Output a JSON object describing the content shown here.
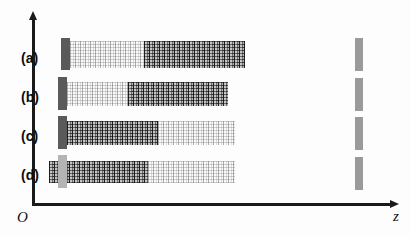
{
  "figure": {
    "title": "",
    "background": "#fdfdfd",
    "width": 411,
    "height": 237
  },
  "axes": {
    "origin_label": "O",
    "x_axis_label": "z",
    "y_axis_label": "",
    "axis_color": "#1a1a1a",
    "vertical": {
      "x": 32,
      "y_top": 14,
      "y_bottom": 205,
      "thickness": 3
    },
    "horizontal": {
      "y": 205,
      "x_left": 32,
      "x_right": 398,
      "thickness": 3
    },
    "origin_label_pos": {
      "x": 16,
      "y": 210
    },
    "x_axis_label_pos": {
      "x": 394,
      "y": 209
    }
  },
  "colors": {
    "source_dark": "#5a5a5a",
    "source_light": "#b4b4b4",
    "detector_gray": "#9a9a9a",
    "mesh_dark": "#3c3c3c",
    "mesh_light": "#d8d8d8",
    "axis": "#1a1a1a",
    "label_text": "#0d0d0d"
  },
  "rows": [
    {
      "label": "(a)",
      "label_pos": {
        "x": 21,
        "y": 51
      },
      "y": 40,
      "height": 28,
      "source": {
        "x": 61,
        "y": 38,
        "width": 9,
        "height": 32,
        "shade": "dark"
      },
      "segments": [
        {
          "kind": "light",
          "x": 70,
          "width": 74
        },
        {
          "kind": "dark",
          "x": 144,
          "width": 101
        }
      ],
      "detector": {
        "x": 355,
        "y": 38,
        "width": 8,
        "height": 33
      }
    },
    {
      "label": "(b)",
      "label_pos": {
        "x": 21,
        "y": 90
      },
      "y": 81,
      "height": 24,
      "source": {
        "x": 58,
        "y": 77,
        "width": 9,
        "height": 33,
        "shade": "dark"
      },
      "segments": [
        {
          "kind": "light",
          "x": 67,
          "width": 61
        },
        {
          "kind": "dark",
          "x": 128,
          "width": 100
        }
      ],
      "detector": {
        "x": 355,
        "y": 78,
        "width": 8,
        "height": 33
      }
    },
    {
      "label": "(c)",
      "label_pos": {
        "x": 21,
        "y": 129
      },
      "y": 120,
      "height": 24,
      "source": {
        "x": 58,
        "y": 116,
        "width": 9,
        "height": 33,
        "shade": "dark"
      },
      "segments": [
        {
          "kind": "dark",
          "x": 67,
          "width": 91
        },
        {
          "kind": "light",
          "x": 158,
          "width": 77
        }
      ],
      "detector": {
        "x": 355,
        "y": 117,
        "width": 8,
        "height": 33
      }
    },
    {
      "label": "(d)",
      "label_pos": {
        "x": 21,
        "y": 168
      },
      "y": 160,
      "height": 22,
      "source": {
        "x": 58,
        "y": 155,
        "width": 9,
        "height": 33,
        "shade": "light"
      },
      "segments": [
        {
          "kind": "dark",
          "x": 49,
          "width": 99
        },
        {
          "kind": "light",
          "x": 148,
          "width": 87
        }
      ],
      "detector": {
        "x": 355,
        "y": 157,
        "width": 8,
        "height": 33
      }
    }
  ]
}
